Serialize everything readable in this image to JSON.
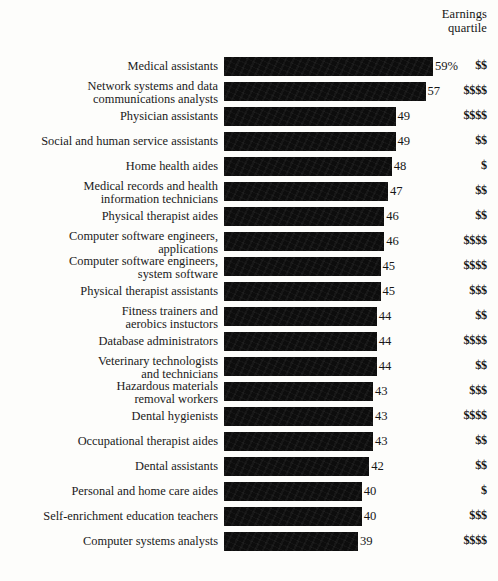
{
  "header": {
    "line1": "Earnings",
    "line2": "quartile"
  },
  "chart_data": {
    "type": "bar",
    "title": "",
    "subtitle": "",
    "xlabel": "",
    "ylabel": "",
    "orientation": "horizontal",
    "grid": false,
    "legend": "none",
    "value_suffix_first": "%",
    "axis_note": "Bars are drawn from a common left baseline; values are percents.",
    "xlim": [
      0,
      60
    ],
    "columns": [
      "Occupation",
      "Percent",
      "Earnings quartile"
    ],
    "categories": [
      "Medical assistants",
      "Network systems and data communications analysts",
      "Physician assistants",
      "Social and human service assistants",
      "Home health aides",
      "Medical records and health information technicians",
      "Physical therapist aides",
      "Computer software engineers, applications",
      "Computer software engineers, system software",
      "Physical therapist assistants",
      "Fitness trainers and aerobics instuctors",
      "Database administrators",
      "Veterinary technologists and technicians",
      "Hazardous materials removal workers",
      "Dental hygienists",
      "Occupational therapist aides",
      "Dental assistants",
      "Personal and home care aides",
      "Self-enrichment education teachers",
      "Computer systems analysts"
    ],
    "values": [
      59,
      57,
      49,
      49,
      48,
      47,
      46,
      46,
      45,
      45,
      44,
      44,
      44,
      43,
      43,
      43,
      42,
      40,
      40,
      39
    ],
    "value_labels": [
      "59%",
      "57",
      "49",
      "49",
      "48",
      "47",
      "46",
      "46",
      "45",
      "45",
      "44",
      "44",
      "44",
      "43",
      "43",
      "43",
      "42",
      "40",
      "40",
      "39"
    ],
    "quartiles": [
      "$$",
      "$$$$",
      "$$$$",
      "$$",
      "$",
      "$$",
      "$$",
      "$$$$",
      "$$$$",
      "$$$",
      "$$",
      "$$$$",
      "$$",
      "$$$",
      "$$$$",
      "$$",
      "$$",
      "$",
      "$$$",
      "$$$$"
    ]
  },
  "rows": [
    {
      "label_lines": [
        "Medical assistants"
      ],
      "value": 59,
      "value_label": "59%",
      "quartile": "$$"
    },
    {
      "label_lines": [
        "Network systems and data",
        "communications analysts"
      ],
      "value": 57,
      "value_label": "57",
      "quartile": "$$$$"
    },
    {
      "label_lines": [
        "Physician assistants"
      ],
      "value": 49,
      "value_label": "49",
      "quartile": "$$$$"
    },
    {
      "label_lines": [
        "Social and human service assistants"
      ],
      "value": 49,
      "value_label": "49",
      "quartile": "$$"
    },
    {
      "label_lines": [
        "Home health aides"
      ],
      "value": 48,
      "value_label": "48",
      "quartile": "$"
    },
    {
      "label_lines": [
        "Medical records and health",
        "information technicians"
      ],
      "value": 47,
      "value_label": "47",
      "quartile": "$$"
    },
    {
      "label_lines": [
        "Physical therapist aides"
      ],
      "value": 46,
      "value_label": "46",
      "quartile": "$$"
    },
    {
      "label_lines": [
        "Computer software engineers,",
        "applications"
      ],
      "value": 46,
      "value_label": "46",
      "quartile": "$$$$"
    },
    {
      "label_lines": [
        "Computer software engineers,",
        "system software"
      ],
      "value": 45,
      "value_label": "45",
      "quartile": "$$$$"
    },
    {
      "label_lines": [
        "Physical therapist assistants"
      ],
      "value": 45,
      "value_label": "45",
      "quartile": "$$$"
    },
    {
      "label_lines": [
        "Fitness trainers and",
        "aerobics instuctors"
      ],
      "value": 44,
      "value_label": "44",
      "quartile": "$$"
    },
    {
      "label_lines": [
        "Database administrators"
      ],
      "value": 44,
      "value_label": "44",
      "quartile": "$$$$"
    },
    {
      "label_lines": [
        "Veterinary technologists",
        "and technicians"
      ],
      "value": 44,
      "value_label": "44",
      "quartile": "$$"
    },
    {
      "label_lines": [
        "Hazardous materials",
        "removal workers"
      ],
      "value": 43,
      "value_label": "43",
      "quartile": "$$$"
    },
    {
      "label_lines": [
        "Dental hygienists"
      ],
      "value": 43,
      "value_label": "43",
      "quartile": "$$$$"
    },
    {
      "label_lines": [
        "Occupational therapist aides"
      ],
      "value": 43,
      "value_label": "43",
      "quartile": "$$"
    },
    {
      "label_lines": [
        "Dental assistants"
      ],
      "value": 42,
      "value_label": "42",
      "quartile": "$$"
    },
    {
      "label_lines": [
        "Personal and home care aides"
      ],
      "value": 40,
      "value_label": "40",
      "quartile": "$"
    },
    {
      "label_lines": [
        "Self-enrichment education teachers"
      ],
      "value": 40,
      "value_label": "40",
      "quartile": "$$$"
    },
    {
      "label_lines": [
        "Computer systems analysts"
      ],
      "value": 39,
      "value_label": "39",
      "quartile": "$$$$"
    }
  ],
  "style": {
    "bar_color": "#0d0d0d",
    "background": "#fdfdfb",
    "text_color": "#151515"
  }
}
